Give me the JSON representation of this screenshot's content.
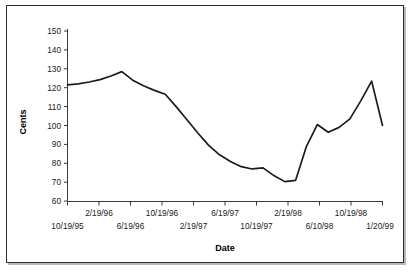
{
  "figure": {
    "border_color": "#2b2b2b",
    "background": "#ffffff"
  },
  "chart_data": {
    "type": "line",
    "title": "",
    "xlabel": "Date",
    "ylabel": "Cents",
    "ylim": [
      60,
      150
    ],
    "ytick_values": [
      60,
      70,
      80,
      90,
      100,
      110,
      120,
      130,
      140,
      150
    ],
    "ytick_labels": [
      "60",
      "70",
      "80",
      "90",
      "100",
      "110",
      "120",
      "130",
      "140",
      "150"
    ],
    "grid": false,
    "legend": null,
    "line_color": "#1c1c1c",
    "xtick_labels_lower": [
      "10/19/95",
      "6/19/96",
      "2/19/97",
      "10/19/97",
      "6/10/98",
      "1/20/99"
    ],
    "xtick_labels_upper": [
      "2/19/96",
      "10/19/96",
      "6/19/97",
      "2/19/98",
      "10/19/98"
    ],
    "xtick_labels_all": [
      "10/19/95",
      "2/19/96",
      "6/19/96",
      "10/19/96",
      "2/19/97",
      "6/19/97",
      "10/19/97",
      "2/19/98",
      "6/10/98",
      "10/19/98",
      "1/20/99"
    ],
    "x": [
      0.0,
      0.4,
      0.8,
      1.2,
      1.6,
      2.0,
      2.4,
      2.8,
      3.2,
      3.6,
      4.0,
      4.4,
      4.8,
      5.2,
      5.6,
      6.0,
      6.4,
      6.8,
      7.2,
      7.6,
      8.0,
      8.4,
      8.8,
      9.2,
      9.6,
      10.0
    ],
    "values": [
      121.5,
      122.0,
      123.0,
      124.3,
      126.2,
      128.5,
      124.5,
      121.5,
      118.8,
      116.5,
      111.0,
      104.0,
      97.0,
      90.5,
      85.0,
      81.5,
      78.8,
      77.2,
      77.5,
      76.5,
      73.0,
      70.3,
      71.2,
      78.0,
      85.0,
      100.0
    ],
    "series_detailed": [
      {
        "label": "10/19/95",
        "value": 121.5
      },
      {
        "label": "",
        "value": 122.0
      },
      {
        "label": "",
        "value": 123.0
      },
      {
        "label": "2/19/96",
        "value": 124.3
      },
      {
        "label": "",
        "value": 126.2
      },
      {
        "label": "",
        "value": 128.5
      },
      {
        "label": "6/19/96",
        "value": 124.0
      },
      {
        "label": "",
        "value": 121.0
      },
      {
        "label": "",
        "value": 118.6
      },
      {
        "label": "10/19/96",
        "value": 116.5
      },
      {
        "label": "",
        "value": 110.0
      },
      {
        "label": "",
        "value": 103.0
      },
      {
        "label": "2/19/97",
        "value": 96.0
      },
      {
        "label": "",
        "value": 89.5
      },
      {
        "label": "",
        "value": 84.5
      },
      {
        "label": "6/19/97",
        "value": 81.0
      },
      {
        "label": "",
        "value": 78.2
      },
      {
        "label": "",
        "value": 77.0
      },
      {
        "label": "",
        "value": 77.6
      },
      {
        "label": "10/19/97",
        "value": 73.5
      },
      {
        "label": "",
        "value": 70.3
      },
      {
        "label": "",
        "value": 71.0
      },
      {
        "label": "2/19/98",
        "value": 89.0
      },
      {
        "label": "",
        "value": 100.5
      },
      {
        "label": "",
        "value": 96.4
      },
      {
        "label": "6/10/98",
        "value": 99.0
      },
      {
        "label": "",
        "value": 103.5
      },
      {
        "label": "10/19/98",
        "value": 113.0
      },
      {
        "label": "",
        "value": 123.5
      },
      {
        "label": "1/20/99",
        "value": 100.0
      }
    ],
    "min_value": 70.3,
    "max_value": 128.5,
    "start_value": 121.5,
    "end_value": 100.0
  }
}
